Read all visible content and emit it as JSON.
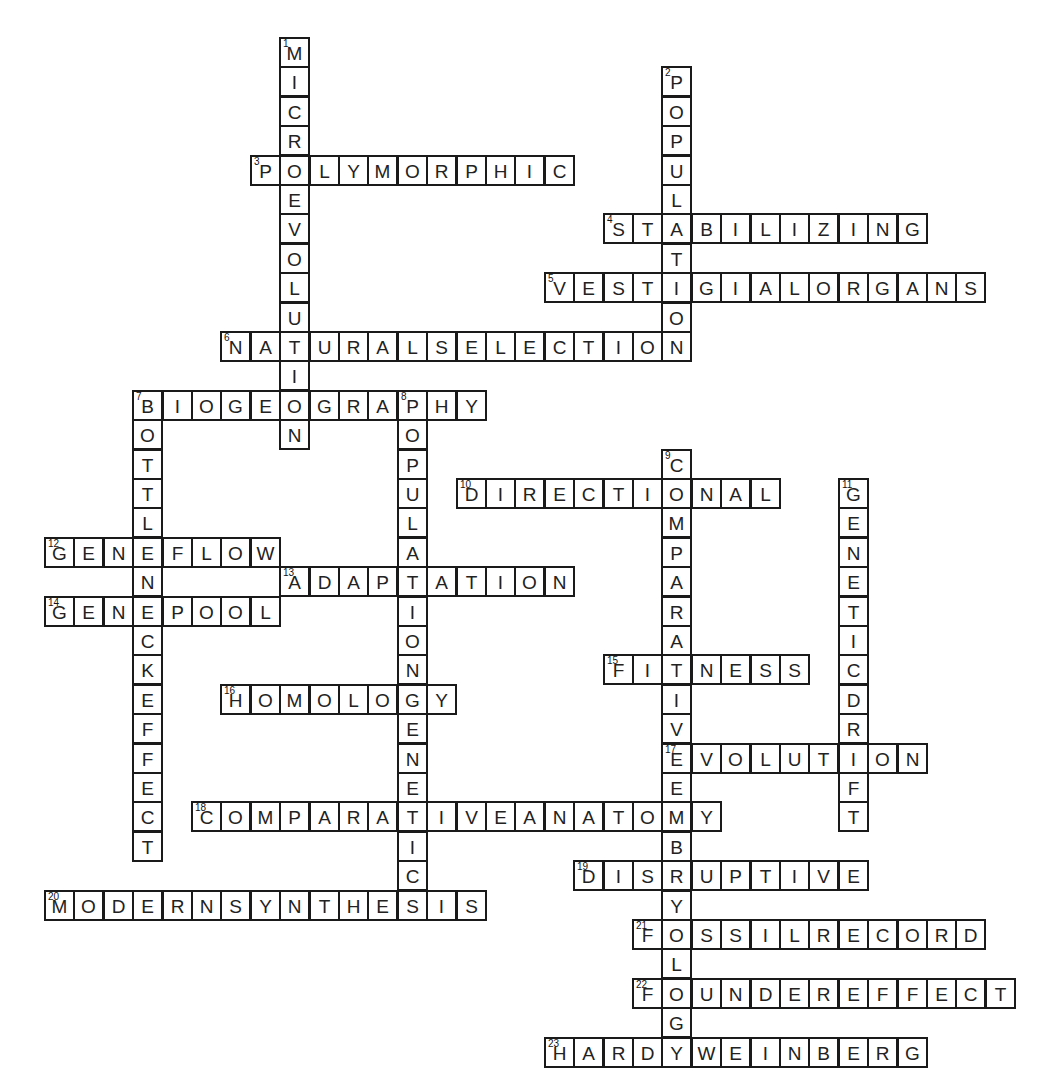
{
  "puzzle": {
    "type": "crossword",
    "grid": {
      "origin_x": 44,
      "origin_y": 37,
      "cell_size": 29.4,
      "cols": 33,
      "rows": 35
    },
    "colors": {
      "border": "#1a1a1a",
      "background": "#ffffff",
      "letter": "#222222"
    },
    "entries": [
      {
        "number": 1,
        "word": "MICROEVOLUTION",
        "direction": "down",
        "col": 8,
        "row": 0
      },
      {
        "number": 2,
        "word": "POPULATION",
        "direction": "down",
        "col": 21,
        "row": 1
      },
      {
        "number": 3,
        "word": "POLYMORPHIC",
        "direction": "across",
        "col": 7,
        "row": 4
      },
      {
        "number": 4,
        "word": "STABILIZING",
        "direction": "across",
        "col": 19,
        "row": 6
      },
      {
        "number": 5,
        "word": "VESTIGIALORGANS",
        "direction": "across",
        "col": 17,
        "row": 8
      },
      {
        "number": 6,
        "word": "NATURALSELECTION",
        "direction": "across",
        "col": 6,
        "row": 10
      },
      {
        "number": 7,
        "word": "BIOGEOGRAPHY",
        "direction": "across",
        "col": 3,
        "row": 12
      },
      {
        "number": 7,
        "word": "BOTTLENECKEFFECT",
        "direction": "down",
        "col": 3,
        "row": 12
      },
      {
        "number": 8,
        "word": "POPULATIONGENETICS",
        "direction": "down",
        "col": 12,
        "row": 12
      },
      {
        "number": 9,
        "word": "COMPARATIVEEMBRYOLOGY",
        "direction": "down",
        "col": 21,
        "row": 14
      },
      {
        "number": 10,
        "word": "DIRECTIONAL",
        "direction": "across",
        "col": 14,
        "row": 15
      },
      {
        "number": 11,
        "word": "GENETICDRIFT",
        "direction": "down",
        "col": 27,
        "row": 15
      },
      {
        "number": 12,
        "word": "GENEFLOW",
        "direction": "across",
        "col": 0,
        "row": 17
      },
      {
        "number": 13,
        "word": "ADAPTATION",
        "direction": "across",
        "col": 8,
        "row": 18
      },
      {
        "number": 14,
        "word": "GENEPOOL",
        "direction": "across",
        "col": 0,
        "row": 19
      },
      {
        "number": 15,
        "word": "FITNESS",
        "direction": "across",
        "col": 19,
        "row": 21
      },
      {
        "number": 16,
        "word": "HOMOLOGY",
        "direction": "across",
        "col": 6,
        "row": 22
      },
      {
        "number": 17,
        "word": "EVOLUTION",
        "direction": "across",
        "col": 21,
        "row": 24
      },
      {
        "number": 18,
        "word": "COMPARATIVEANATOMY",
        "direction": "across",
        "col": 5,
        "row": 26
      },
      {
        "number": 19,
        "word": "DISRUPTIVE",
        "direction": "across",
        "col": 18,
        "row": 28
      },
      {
        "number": 20,
        "word": "MODERNSYNTHESIS",
        "direction": "across",
        "col": 0,
        "row": 29
      },
      {
        "number": 21,
        "word": "FOSSILRECORD",
        "direction": "across",
        "col": 20,
        "row": 30
      },
      {
        "number": 22,
        "word": "FOUNDEREFFECT",
        "direction": "across",
        "col": 20,
        "row": 32
      },
      {
        "number": 23,
        "word": "HARDYWEINBERG",
        "direction": "across",
        "col": 17,
        "row": 34
      }
    ]
  }
}
